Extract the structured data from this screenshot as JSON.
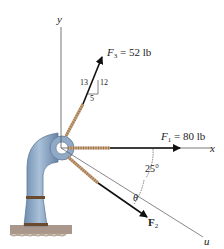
{
  "diagram": {
    "type": "force-diagram",
    "axes": {
      "x_label": "x",
      "y_label": "y",
      "u_label": "u"
    },
    "forces": [
      {
        "id": "F1",
        "symbol": "F",
        "subscript": "1",
        "equals": " = 80 lb",
        "magnitude": 80,
        "unit": "lb",
        "direction": "along +x"
      },
      {
        "id": "F2",
        "symbol": "F",
        "subscript": "2",
        "magnitude": null,
        "direction": "angle θ below u-axis"
      },
      {
        "id": "F3",
        "symbol": "F",
        "subscript": "3",
        "equals": " = 52 lb",
        "magnitude": 52,
        "unit": "lb",
        "slope_triangle": {
          "hypotenuse": "13",
          "rise": "12",
          "run": "5"
        }
      }
    ],
    "angles": {
      "u_from_x": "25°",
      "theta": "θ"
    },
    "colors": {
      "pipe": "#8fa9c6",
      "pipe_dark": "#5d7a99",
      "band": "#6b4a2e",
      "ground": "#9c8a78",
      "cable": "#c9a27a",
      "arrow": "#111111"
    }
  }
}
